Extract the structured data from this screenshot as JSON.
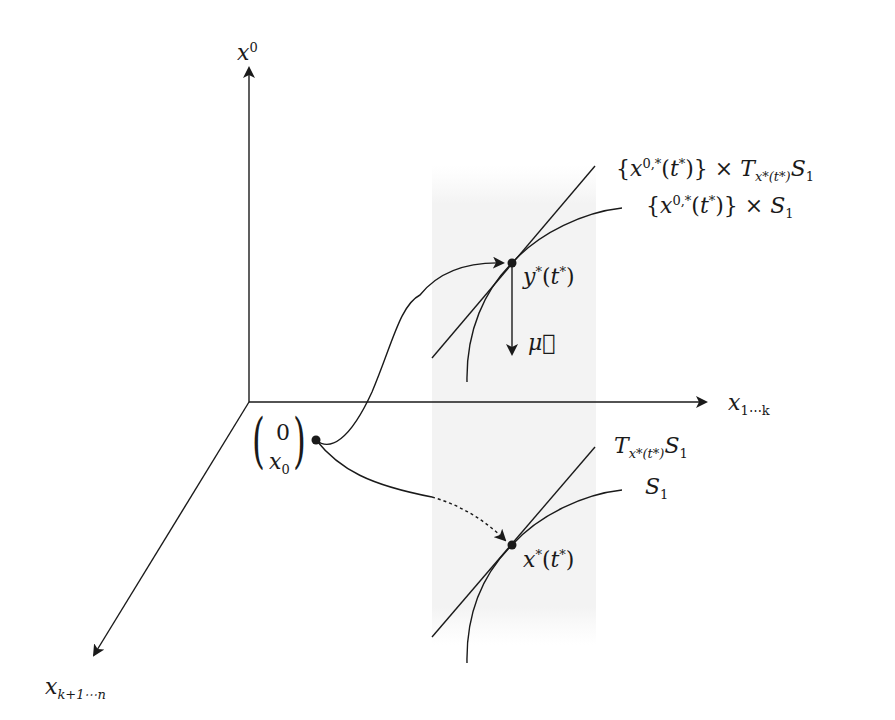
{
  "diagram": {
    "type": "3d-coordinate-schematic",
    "colors": {
      "stroke": "#1a1a1a",
      "band": "#f3f3f3",
      "background": "#ffffff"
    },
    "axes": {
      "vertical": {
        "label_base": "x",
        "label_sup": "0"
      },
      "horizontal": {
        "label_base": "x",
        "label_sub": "1⋯k"
      },
      "diagonal": {
        "label_base": "x",
        "label_sub": "k+1⋯n"
      }
    },
    "start_point": {
      "top": "0",
      "bottom_base": "x",
      "bottom_sub": "0"
    },
    "upper": {
      "point_label_base": "y",
      "point_label_sup": "*",
      "point_label_arg": "(t",
      "point_label_arg_sup": "*",
      "point_label_close": ")",
      "normal_label": "μ⃗",
      "tangent_label": {
        "open": "{x",
        "sup": "0,*",
        "mid": "(t",
        "mid_sup": "*",
        "close": ")} × T",
        "sub": "x*(t*)",
        "tail": "S",
        "tail_sub": "1"
      },
      "manifold_label": {
        "open": "{x",
        "sup": "0,*",
        "mid": "(t",
        "mid_sup": "*",
        "close": ")} × S",
        "tail_sub": "1"
      }
    },
    "lower": {
      "point_label_base": "x",
      "point_label_sup": "*",
      "point_label_arg": "(t",
      "point_label_arg_sup": "*",
      "point_label_close": ")",
      "tangent_label": {
        "base": "T",
        "sub": "x*(t*)",
        "tail": "S",
        "tail_sub": "1"
      },
      "manifold_label": {
        "base": "S",
        "sub": "1"
      }
    }
  }
}
